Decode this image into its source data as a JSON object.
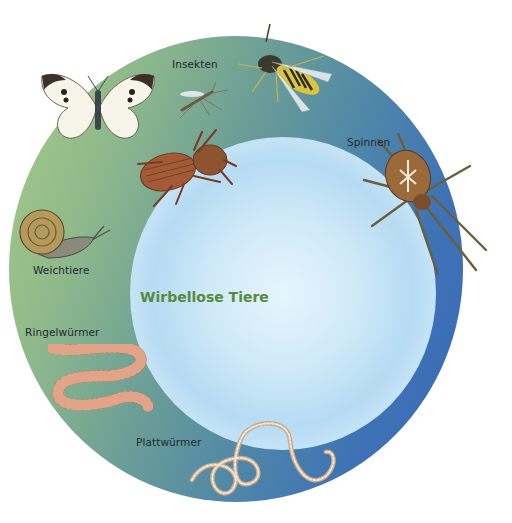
{
  "diagram": {
    "title": "Wirbellose Tiere",
    "groups": [
      {
        "label": "Insekten",
        "animals": [
          "butterfly",
          "mosquito",
          "wasp",
          "beetle"
        ]
      },
      {
        "label": "Spinnen",
        "animals": [
          "garden-spider"
        ]
      },
      {
        "label": "Weichtiere",
        "animals": [
          "snail"
        ]
      },
      {
        "label": "Ringelwürmer",
        "animals": [
          "earthworm"
        ]
      },
      {
        "label": "Plattwürmer",
        "animals": [
          "flatworm"
        ]
      }
    ]
  },
  "colors": {
    "ring_left": "#a9cc86",
    "ring_right": "#3a69b8",
    "disc": "#cfe9f8",
    "title": "#5a8a3c",
    "label": "#1e2a2e"
  }
}
